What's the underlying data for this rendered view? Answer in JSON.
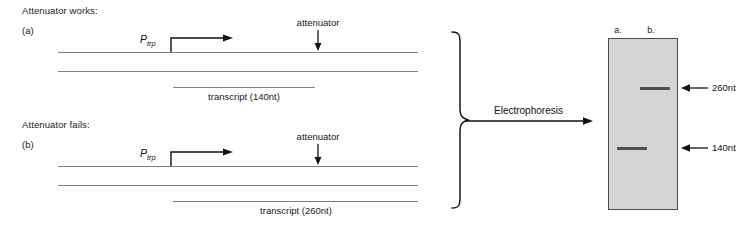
{
  "figure": {
    "width": 744,
    "height": 227,
    "background": "#ffffff"
  },
  "panel_a": {
    "heading": "Attenuator works:",
    "letter": "(a)",
    "promoter_label": "P",
    "promoter_subscript": "trp",
    "attenuator_label": "attenuator",
    "transcript_caption": "transcript (140nt)",
    "transcript_length_nt": 140,
    "transcript_reads_through": false
  },
  "panel_b": {
    "heading": "Attenuator fails:",
    "letter": "(b)",
    "promoter_label": "P",
    "promoter_subscript": "trp",
    "attenuator_label": "attenuator",
    "transcript_caption": "transcript (260nt)",
    "transcript_length_nt": 260,
    "transcript_reads_through": true
  },
  "process": {
    "label": "Electrophoresis"
  },
  "gel": {
    "background_color": "#d4d4d4",
    "border_color": "#4a4a4a",
    "band_color": "#4f4f4f",
    "lanes": [
      {
        "label": "a.",
        "band_size": "140nt"
      },
      {
        "label": "b.",
        "band_size": "260nt"
      }
    ],
    "markers": [
      {
        "label": "260nt"
      },
      {
        "label": "140nt"
      }
    ]
  },
  "colors": {
    "strand": "#808080",
    "text": "#1a1a1a",
    "arrow": "#111111"
  }
}
